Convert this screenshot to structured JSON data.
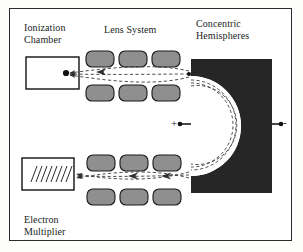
{
  "figure": {
    "background_color": "#fdfdfc",
    "frame_color": "#2b2b2b"
  },
  "labels": {
    "ionization_chamber": "Ionization\nChamber",
    "lens_system": "Lens System",
    "concentric_hemispheres": "Concentric\nHemispheres",
    "electron_multiplier": "Electron\nMultiplier"
  },
  "polarity": {
    "positive": "+",
    "negative": "-"
  },
  "components": {
    "ionization_chamber": {
      "name": "ionization-chamber-box",
      "fill": "#ffffff",
      "stroke": "#111111",
      "source_point": "ion source dot"
    },
    "electron_multiplier": {
      "name": "electron-multiplier-box",
      "fill": "#ffffff",
      "stroke": "#111111",
      "dynode_hatch_count": 9
    },
    "hemispheres": {
      "name": "concentric-hemispheres-block",
      "fill": "#262626",
      "channel_fill": "#ffffff"
    },
    "lens_electrodes": {
      "fill": "#8f8f8f",
      "stroke": "#1a1a1a",
      "count": 12,
      "rows": 4,
      "per_row": 3
    },
    "trajectories": {
      "stroke": "#3a3a3a",
      "style": "dashed",
      "count": 3,
      "arrow_direction": "toward ionization chamber and electron multiplier"
    }
  }
}
